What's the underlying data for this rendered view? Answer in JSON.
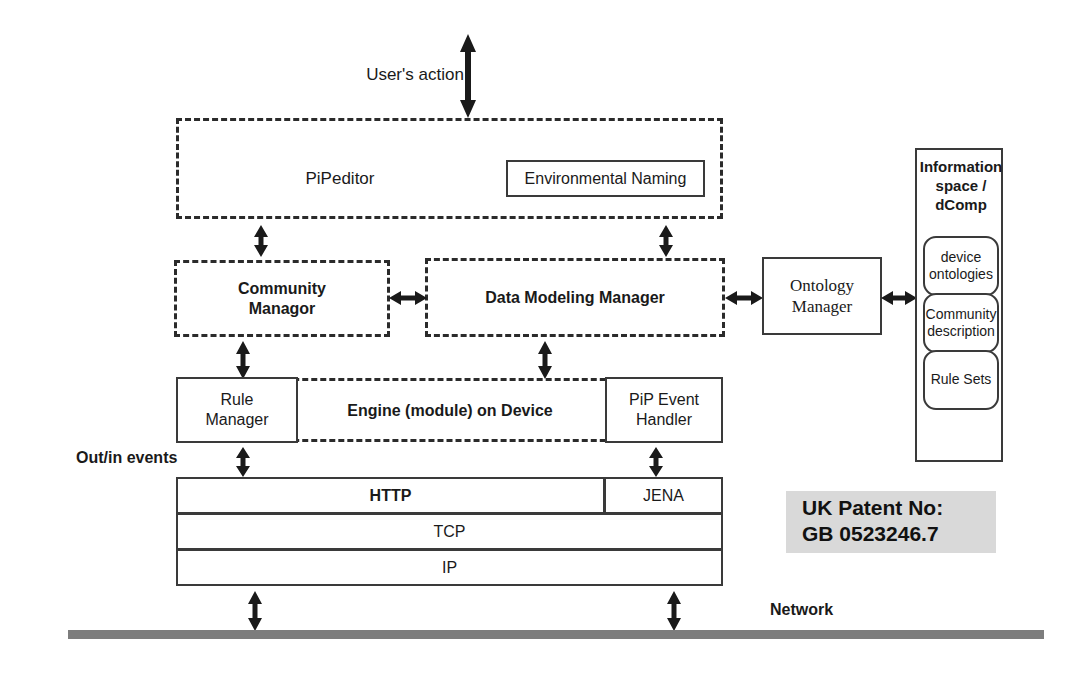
{
  "diagram": {
    "title_note": "System architecture diagram",
    "labels": {
      "users_action": "User's action",
      "out_in_events": "Out/in events",
      "network": "Network",
      "pipeditor": "PiPeditor",
      "environmental_naming": "Environmental Naming",
      "community_manager": "Community\nManagor",
      "data_modeling_manager": "Data Modeling Manager",
      "ontology_manager": "Ontology\nManager",
      "information_space": "Information\nspace /\ndComp",
      "device_ontologies": "device\nontologies",
      "community_description": "Community\ndescription",
      "rule_sets": "Rule Sets",
      "rule_manager": "Rule\nManager",
      "engine_on_device": "Engine (module) on Device",
      "pip_event_handler": "PiP Event\nHandler",
      "http": "HTTP",
      "jena": "JENA",
      "tcp": "TCP",
      "ip": "IP"
    },
    "patent": {
      "line1": "UK Patent No:",
      "line2": "GB 0523246.7"
    },
    "colors": {
      "stroke": "#3a3a3a",
      "dashed_stroke": "#2b2b2b",
      "network_bus": "#7d7d7d",
      "patent_badge_bg": "#d9d9d9",
      "text": "#1a1a1a"
    }
  }
}
